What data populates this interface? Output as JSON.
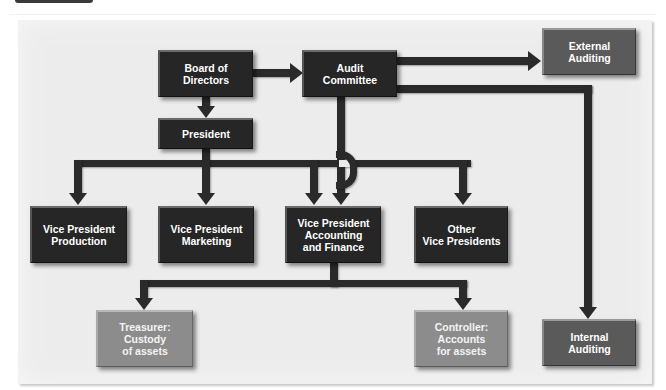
{
  "diagram": {
    "type": "organization-chart",
    "colors": {
      "background": "#ececec",
      "dark_box": "#262626",
      "mid_box": "#5a5a5a",
      "light_box": "#8c8c8c",
      "connector": "#2a2a2a",
      "text": "#ffffff"
    },
    "nodes": {
      "board": {
        "label": "Board of\nDirectors",
        "style": "dark"
      },
      "audit_committee": {
        "label": "Audit\nCommittee",
        "style": "dark"
      },
      "external_auditing": {
        "label": "External\nAuditing",
        "style": "mid"
      },
      "president": {
        "label": "President",
        "style": "dark"
      },
      "vp_production": {
        "label": "Vice President\nProduction",
        "style": "dark"
      },
      "vp_marketing": {
        "label": "Vice President\nMarketing",
        "style": "dark"
      },
      "vp_accounting": {
        "label": "Vice President\nAccounting\nand Finance",
        "style": "dark"
      },
      "other_vps": {
        "label": "Other\nVice Presidents",
        "style": "dark"
      },
      "treasurer": {
        "label": "Treasurer:\nCustody\nof assets",
        "style": "light"
      },
      "controller": {
        "label": "Controller:\nAccounts\nfor assets",
        "style": "light"
      },
      "internal_auditing": {
        "label": "Internal\nAuditing",
        "style": "mid"
      }
    },
    "edges": [
      {
        "from": "board",
        "to": "audit_committee"
      },
      {
        "from": "board",
        "to": "president"
      },
      {
        "from": "audit_committee",
        "to": "external_auditing"
      },
      {
        "from": "audit_committee",
        "to": "internal_auditing"
      },
      {
        "from": "audit_committee",
        "to": "vp_accounting"
      },
      {
        "from": "president",
        "to": "vp_production"
      },
      {
        "from": "president",
        "to": "vp_marketing"
      },
      {
        "from": "president",
        "to": "vp_accounting"
      },
      {
        "from": "president",
        "to": "other_vps"
      },
      {
        "from": "vp_accounting",
        "to": "treasurer"
      },
      {
        "from": "vp_accounting",
        "to": "controller"
      }
    ]
  }
}
